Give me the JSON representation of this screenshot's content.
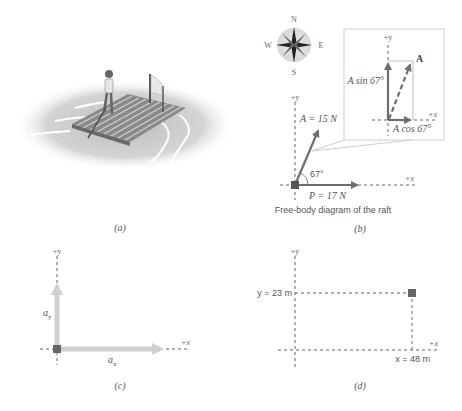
{
  "panels": {
    "a": {
      "label": "(a)",
      "subject": "raft-scene"
    },
    "b": {
      "label": "(b)",
      "caption": "Free-body diagram of the raft",
      "compass": {
        "n": "N",
        "s": "S",
        "e": "E",
        "w": "W"
      },
      "axis_x": "+x",
      "axis_y": "+y",
      "vector_A": "A = 15 N",
      "vector_P": "P = 17 N",
      "angle": "67°",
      "inset": {
        "axis_x": "+x",
        "axis_y": "+y",
        "vector_label": "A",
        "y_component": "A sin 67°",
        "x_component": "A cos 67°"
      }
    },
    "c": {
      "label": "(c)",
      "axis_x": "+x",
      "axis_y": "+y",
      "comp_y": "a",
      "comp_y_sub": "y",
      "comp_x": "a",
      "comp_x_sub": "x"
    },
    "d": {
      "label": "(d)",
      "axis_x": "+x",
      "axis_y": "+y",
      "y_value": "y = 23 m",
      "x_value": "x = 48 m"
    }
  },
  "colors": {
    "vector": "#6e6e6e",
    "component_light": "#c9c9c9",
    "axis": "#666666",
    "inset_border": "#cfcfcf",
    "water": "#d9d9d9"
  }
}
